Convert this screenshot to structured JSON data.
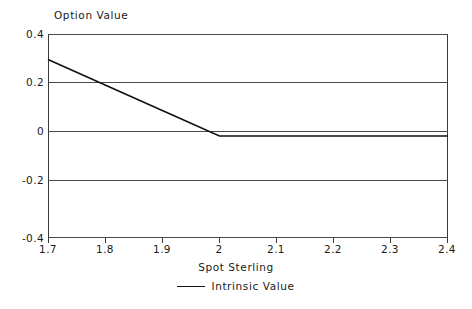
{
  "chart_data": {
    "type": "line",
    "title": "",
    "xlabel": "Spot Sterling",
    "ylabel": "Option Value",
    "xlim": [
      1.7,
      2.4
    ],
    "ylim": [
      -0.4,
      0.4
    ],
    "grid": true,
    "legend_position": "bottom-center",
    "xticks": [
      "1.7",
      "1.8",
      "1.9",
      "2",
      "2.1",
      "2.2",
      "2.3",
      "2.4"
    ],
    "xtick_values": [
      1.7,
      1.8,
      1.9,
      2.0,
      2.1,
      2.2,
      2.3,
      2.4
    ],
    "yticks": [
      "0.4",
      "0.2",
      "0",
      "-0.2",
      "-0.4"
    ],
    "ytick_values": [
      0.4,
      0.2,
      0,
      -0.2,
      -0.4
    ],
    "series": [
      {
        "name": "Intrinsic Value",
        "color": "#111111",
        "x": [
          1.7,
          1.8,
          1.9,
          2.0,
          2.1,
          2.2,
          2.3,
          2.4
        ],
        "values": [
          0.3,
          0.2,
          0.1,
          0.0,
          0.0,
          0.0,
          0.0,
          0.0
        ]
      }
    ],
    "legend": [
      "Intrinsic Value"
    ],
    "colors": {
      "line": "#111111",
      "grid": "#4a4a4a",
      "axis": "#3a3a3a",
      "background": "#ffffff",
      "text": "#1a1a1a"
    }
  }
}
